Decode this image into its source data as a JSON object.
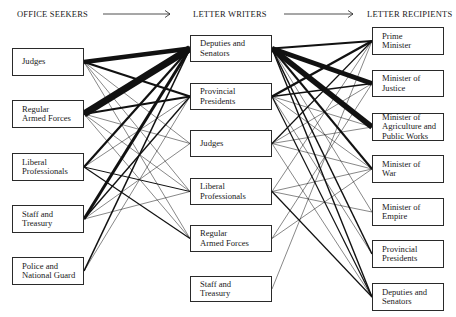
{
  "headers": {
    "office_seekers": "OFFICE SEEKERS",
    "letter_writers": "LETTER WRITERS",
    "letter_recipients": "LETTER RECIPIENTS"
  },
  "columns": {
    "office_seekers": [
      {
        "label": "Judges",
        "box": [
          12,
          48,
          72,
          28
        ]
      },
      {
        "label": "Regular\nArmed Forces",
        "box": [
          12,
          100,
          72,
          28
        ]
      },
      {
        "label": "Liberal\nProfessionals",
        "box": [
          12,
          153,
          72,
          28
        ]
      },
      {
        "label": "Staff and\nTreasury",
        "box": [
          12,
          205,
          72,
          28
        ]
      },
      {
        "label": "Police and\nNational Guard",
        "box": [
          12,
          257,
          72,
          28
        ]
      }
    ],
    "letter_writers": [
      {
        "label": "Deputies and\nSenators",
        "box": [
          190,
          35,
          82,
          27
        ]
      },
      {
        "label": "Provincial\nPresidents",
        "box": [
          190,
          83,
          82,
          27
        ]
      },
      {
        "label": "Judges",
        "box": [
          190,
          130,
          82,
          27
        ]
      },
      {
        "label": "Liberal\nProfessionals",
        "box": [
          190,
          178,
          82,
          27
        ]
      },
      {
        "label": "Regular\nArmed Forces",
        "box": [
          190,
          225,
          82,
          27
        ]
      },
      {
        "label": "Staff and\nTreasury",
        "box": [
          190,
          276,
          82,
          26
        ]
      }
    ],
    "letter_recipients": [
      {
        "label": "Prime\nMinister",
        "box": [
          372,
          27,
          72,
          28
        ]
      },
      {
        "label": "Minister of\nJustice",
        "box": [
          372,
          70,
          72,
          27
        ]
      },
      {
        "label": "Minister of\nAgriculture and\nPublic Works",
        "box": [
          372,
          113,
          72,
          28
        ]
      },
      {
        "label": "Minister of\nWar",
        "box": [
          372,
          155,
          72,
          28
        ]
      },
      {
        "label": "Minister of\nEmpire",
        "box": [
          372,
          198,
          72,
          28
        ]
      },
      {
        "label": "Provincial\nPresidents",
        "box": [
          372,
          240,
          72,
          28
        ]
      },
      {
        "label": "Deputies and\nSenators",
        "box": [
          372,
          283,
          72,
          28
        ]
      }
    ]
  },
  "arrows": [
    {
      "x1": 103,
      "y1": 14,
      "x2": 170,
      "y2": 14
    },
    {
      "x1": 284,
      "y1": 14,
      "x2": 353,
      "y2": 14
    }
  ],
  "links_seekers_to_writers": [
    {
      "from": 0,
      "to": 0,
      "w": 4.5
    },
    {
      "from": 0,
      "to": 1,
      "w": 2.2
    },
    {
      "from": 0,
      "to": 2,
      "w": 0.5
    },
    {
      "from": 0,
      "to": 3,
      "w": 0.5
    },
    {
      "from": 0,
      "to": 4,
      "w": 0.5
    },
    {
      "from": 1,
      "to": 0,
      "w": 7
    },
    {
      "from": 1,
      "to": 1,
      "w": 2.2
    },
    {
      "from": 1,
      "to": 2,
      "w": 0.5
    },
    {
      "from": 1,
      "to": 3,
      "w": 0.5
    },
    {
      "from": 1,
      "to": 4,
      "w": 0.5
    },
    {
      "from": 2,
      "to": 0,
      "w": 2.2
    },
    {
      "from": 2,
      "to": 1,
      "w": 0.5
    },
    {
      "from": 2,
      "to": 3,
      "w": 1
    },
    {
      "from": 2,
      "to": 4,
      "w": 1.2
    },
    {
      "from": 3,
      "to": 0,
      "w": 3
    },
    {
      "from": 3,
      "to": 1,
      "w": 1.4
    },
    {
      "from": 3,
      "to": 2,
      "w": 0.5
    },
    {
      "from": 3,
      "to": 3,
      "w": 0.5
    },
    {
      "from": 4,
      "to": 0,
      "w": 1.6
    },
    {
      "from": 4,
      "to": 1,
      "w": 0.5
    }
  ],
  "links_writers_to_recipients": [
    {
      "from": 0,
      "to": 0,
      "w": 2
    },
    {
      "from": 0,
      "to": 1,
      "w": 5
    },
    {
      "from": 0,
      "to": 2,
      "w": 5.5
    },
    {
      "from": 0,
      "to": 3,
      "w": 2
    },
    {
      "from": 0,
      "to": 4,
      "w": 0.5
    },
    {
      "from": 0,
      "to": 5,
      "w": 1.5
    },
    {
      "from": 0,
      "to": 6,
      "w": 1.4
    },
    {
      "from": 1,
      "to": 0,
      "w": 2.4
    },
    {
      "from": 1,
      "to": 1,
      "w": 1.6
    },
    {
      "from": 1,
      "to": 2,
      "w": 0.5
    },
    {
      "from": 1,
      "to": 3,
      "w": 0.5
    },
    {
      "from": 1,
      "to": 5,
      "w": 0.5
    },
    {
      "from": 1,
      "to": 6,
      "w": 1.2
    },
    {
      "from": 2,
      "to": 0,
      "w": 1.2
    },
    {
      "from": 2,
      "to": 1,
      "w": 0.5
    },
    {
      "from": 2,
      "to": 2,
      "w": 0.5
    },
    {
      "from": 2,
      "to": 3,
      "w": 0.5
    },
    {
      "from": 2,
      "to": 6,
      "w": 0.5
    },
    {
      "from": 3,
      "to": 0,
      "w": 0.5
    },
    {
      "from": 3,
      "to": 3,
      "w": 0.5
    },
    {
      "from": 3,
      "to": 4,
      "w": 0.5
    },
    {
      "from": 3,
      "to": 6,
      "w": 1.2
    },
    {
      "from": 4,
      "to": 1,
      "w": 0.5
    },
    {
      "from": 4,
      "to": 3,
      "w": 0.5
    },
    {
      "from": 5,
      "to": 0,
      "w": 0.5
    }
  ],
  "colors": {
    "line": "#111111",
    "box_border": "#2a2a2a",
    "text": "#1a1a1a",
    "background": "#ffffff"
  }
}
